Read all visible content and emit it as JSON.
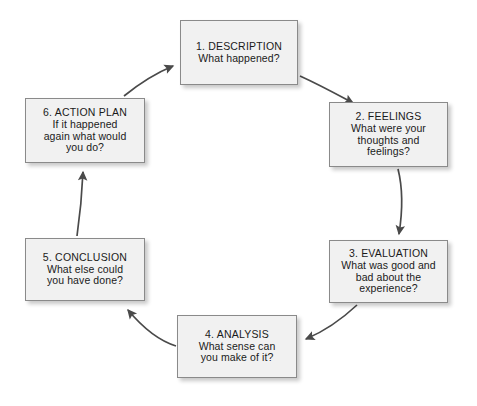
{
  "diagram": {
    "type": "cycle-flow-diagram",
    "colors": {
      "box_fill": "#f1f1f1",
      "box_border": "#8a8a8a",
      "arrow": "#4a4a4a",
      "text": "#1a1a1a",
      "background": "#ffffff"
    },
    "nodes": [
      {
        "id": "node-1",
        "title": "1. DESCRIPTION",
        "lines": [
          "What happened?"
        ]
      },
      {
        "id": "node-2",
        "title": "2. FEELINGS",
        "lines": [
          "What were your",
          "thoughts and",
          "feelings?"
        ]
      },
      {
        "id": "node-3",
        "title": "3. EVALUATION",
        "lines": [
          "What was good and",
          "bad about the",
          "experience?"
        ]
      },
      {
        "id": "node-4",
        "title": "4. ANALYSIS",
        "lines": [
          "What sense can",
          "you make of it?"
        ]
      },
      {
        "id": "node-5",
        "title": "5. CONCLUSION",
        "lines": [
          "What else could",
          "you have done?"
        ]
      },
      {
        "id": "node-6",
        "title": "6. ACTION PLAN",
        "lines": [
          "If it happened",
          "again what would",
          "you do?"
        ]
      }
    ],
    "edges": [
      {
        "id": "edge-1-2",
        "from": "1. DESCRIPTION",
        "to": "2. FEELINGS"
      },
      {
        "id": "edge-2-3",
        "from": "2. FEELINGS",
        "to": "3. EVALUATION"
      },
      {
        "id": "edge-3-4",
        "from": "3. EVALUATION",
        "to": "4. ANALYSIS"
      },
      {
        "id": "edge-4-5",
        "from": "4. ANALYSIS",
        "to": "5. CONCLUSION"
      },
      {
        "id": "edge-5-6",
        "from": "5. CONCLUSION",
        "to": "6. ACTION PLAN"
      },
      {
        "id": "edge-6-1",
        "from": "6. ACTION PLAN",
        "to": "1. DESCRIPTION"
      }
    ]
  }
}
